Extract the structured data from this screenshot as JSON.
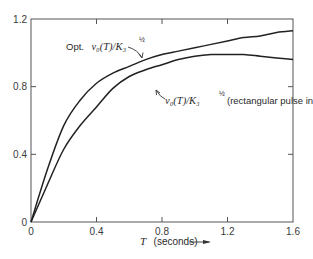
{
  "chart_data": {
    "type": "line",
    "title": "",
    "xlabel": "T (seconds)",
    "xlabel_var": "T",
    "xlabel_unit": "(seconds)",
    "ylabel": "",
    "xlim": [
      0,
      1.6
    ],
    "ylim": [
      0,
      1.2
    ],
    "grid": false,
    "legend": "none (curves labeled with inline annotations)",
    "x_ticks": [
      "0",
      "0.4",
      "0.8",
      "1.2",
      "1.6"
    ],
    "y_ticks": [
      "0",
      "0.4",
      "0.8",
      "1.2"
    ],
    "x": [
      0,
      0.1,
      0.2,
      0.3,
      0.4,
      0.5,
      0.6,
      0.7,
      0.8,
      0.9,
      1.0,
      1.1,
      1.2,
      1.3,
      1.4,
      1.5,
      1.6
    ],
    "series": [
      {
        "name": "Opt. v0(T)/K3^1/2",
        "values": [
          0,
          0.31,
          0.57,
          0.72,
          0.82,
          0.88,
          0.92,
          0.96,
          0.99,
          1.01,
          1.03,
          1.05,
          1.07,
          1.09,
          1.1,
          1.12,
          1.13
        ]
      },
      {
        "name": "v0(T)/K3^1/2 (rectangular pulse input)",
        "values": [
          0,
          0.22,
          0.43,
          0.57,
          0.68,
          0.79,
          0.86,
          0.9,
          0.93,
          0.96,
          0.98,
          0.99,
          0.99,
          0.99,
          0.98,
          0.97,
          0.96
        ]
      }
    ],
    "annotations": [
      {
        "text": "Opt. v0(T)/K3^1/2",
        "points_to": "upper curve near T=0.75"
      },
      {
        "text": "v0(T)/K3^1/2 (rectangular pulse input)",
        "points_to": "lower curve near T=0.55"
      }
    ]
  },
  "labels": {
    "upper_prefix": "Opt.",
    "upper_expr": "v₀(T)/K₃",
    "upper_exp": "½",
    "lower_expr": "v₀(T)/K₃",
    "lower_exp": "½",
    "lower_suffix": "(rectangular pulse input)",
    "x_axis_var": "T",
    "x_axis_unit": "(seconds)",
    "arrow": "⟶"
  }
}
